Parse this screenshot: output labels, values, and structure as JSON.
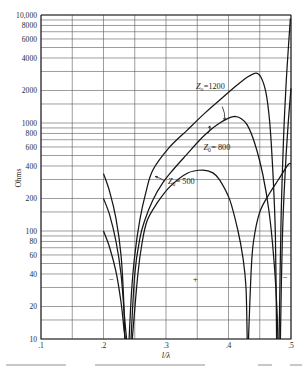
{
  "chart_data": {
    "type": "line",
    "title": "",
    "xlabel": "l/λ",
    "ylabel": "Ohms",
    "xlim": [
      0.1,
      0.5
    ],
    "ylim": [
      10,
      10000
    ],
    "yscale": "log",
    "grid": true,
    "x_ticks": [
      {
        "value": 0.1,
        "label": ".1"
      },
      {
        "value": 0.2,
        "label": ".2"
      },
      {
        "value": 0.3,
        "label": ".3"
      },
      {
        "value": 0.4,
        "label": ".4"
      },
      {
        "value": 0.5,
        "label": ".5"
      }
    ],
    "x_gridlines": [
      0.1,
      0.15,
      0.2,
      0.25,
      0.3,
      0.35,
      0.4,
      0.45,
      0.5
    ],
    "y_ticks": [
      {
        "value": 10000,
        "label": "10,000"
      },
      {
        "value": 8000,
        "label": "8000"
      },
      {
        "value": 6000,
        "label": "6000"
      },
      {
        "value": 4000,
        "label": "4000"
      },
      {
        "value": 2000,
        "label": "2000"
      },
      {
        "value": 1000,
        "label": "1000"
      },
      {
        "value": 800,
        "label": "800"
      },
      {
        "value": 600,
        "label": "600"
      },
      {
        "value": 400,
        "label": "400"
      },
      {
        "value": 200,
        "label": "200"
      },
      {
        "value": 100,
        "label": "100"
      },
      {
        "value": 80,
        "label": "80"
      },
      {
        "value": 60,
        "label": "60"
      },
      {
        "value": 40,
        "label": "40"
      },
      {
        "value": 20,
        "label": "20"
      },
      {
        "value": 10,
        "label": "10"
      }
    ],
    "y_gridlines": [
      10,
      15,
      20,
      30,
      40,
      50,
      60,
      70,
      80,
      90,
      100,
      150,
      200,
      300,
      400,
      500,
      600,
      700,
      800,
      900,
      1000,
      1500,
      2000,
      3000,
      4000,
      5000,
      6000,
      7000,
      8000,
      9000,
      10000
    ],
    "series": [
      {
        "name": "Z0 = 1200",
        "segments": [
          [
            [
              0.2,
              340
            ],
            [
              0.21,
              230
            ],
            [
              0.22,
              130
            ],
            [
              0.228,
              60
            ],
            [
              0.232,
              25
            ],
            [
              0.234,
              10
            ]
          ],
          [
            [
              0.241,
              10
            ],
            [
              0.245,
              28
            ],
            [
              0.25,
              60
            ],
            [
              0.258,
              126
            ],
            [
              0.268,
              230
            ],
            [
              0.279,
              367
            ],
            [
              0.305,
              590
            ],
            [
              0.334,
              860
            ],
            [
              0.36,
              1200
            ],
            [
              0.386,
              1630
            ],
            [
              0.41,
              2150
            ],
            [
              0.43,
              2650
            ],
            [
              0.444,
              2900
            ],
            [
              0.452,
              2650
            ],
            [
              0.46,
              1900
            ],
            [
              0.466,
              1000
            ],
            [
              0.471,
              350
            ],
            [
              0.475,
              90
            ],
            [
              0.477,
              10
            ]
          ],
          [
            [
              0.481,
              10
            ],
            [
              0.484,
              120
            ],
            [
              0.488,
              700
            ],
            [
              0.492,
              2200
            ],
            [
              0.496,
              5200
            ],
            [
              0.499,
              9300
            ]
          ]
        ]
      },
      {
        "name": "Z0 = 800",
        "segments": [
          [
            [
              0.2,
              200
            ],
            [
              0.21,
              140
            ],
            [
              0.22,
              80
            ],
            [
              0.228,
              40
            ],
            [
              0.234,
              15
            ],
            [
              0.237,
              10
            ]
          ],
          [
            [
              0.244,
              10
            ],
            [
              0.25,
              40
            ],
            [
              0.258,
              85
            ],
            [
              0.266,
              126
            ],
            [
              0.279,
              194
            ],
            [
              0.295,
              280
            ],
            [
              0.311,
              367
            ],
            [
              0.333,
              510
            ],
            [
              0.354,
              696
            ],
            [
              0.372,
              870
            ],
            [
              0.386,
              1000
            ],
            [
              0.4,
              1110
            ],
            [
              0.41,
              1150
            ],
            [
              0.42,
              1100
            ],
            [
              0.43,
              960
            ],
            [
              0.442,
              650
            ],
            [
              0.455,
              330
            ],
            [
              0.465,
              150
            ],
            [
              0.472,
              60
            ],
            [
              0.477,
              22
            ],
            [
              0.479,
              10
            ]
          ],
          [
            [
              0.483,
              10
            ],
            [
              0.486,
              80
            ],
            [
              0.49,
              300
            ],
            [
              0.495,
              900
            ],
            [
              0.5,
              2100
            ]
          ]
        ]
      },
      {
        "name": "Z0 = 500",
        "segments": [
          [
            [
              0.2,
              100
            ],
            [
              0.21,
              70
            ],
            [
              0.22,
              42
            ],
            [
              0.228,
              22
            ],
            [
              0.233,
              12
            ],
            [
              0.235,
              10
            ]
          ],
          [
            [
              0.246,
              10
            ],
            [
              0.255,
              40
            ],
            [
              0.262,
              80
            ],
            [
              0.27,
              126
            ],
            [
              0.286,
              182
            ],
            [
              0.306,
              256
            ],
            [
              0.334,
              343
            ],
            [
              0.359,
              367
            ],
            [
              0.375,
              345
            ],
            [
              0.386,
              296
            ],
            [
              0.402,
              194
            ],
            [
              0.415,
              101
            ],
            [
              0.423,
              57
            ],
            [
              0.428,
              30
            ],
            [
              0.43,
              10
            ]
          ],
          [
            [
              0.432,
              10
            ],
            [
              0.436,
              40
            ],
            [
              0.44,
              80
            ],
            [
              0.45,
              150
            ],
            [
              0.466,
              225
            ],
            [
              0.48,
              300
            ],
            [
              0.495,
              408
            ],
            [
              0.5,
              420
            ]
          ]
        ]
      }
    ],
    "annotations": [
      {
        "symbol": "Z",
        "sub": "o",
        "value": "=1200",
        "x": 0.348,
        "y": 2050,
        "leader_from": [
          0.39,
          1420
        ],
        "leader_to": [
          0.394,
          1060
        ]
      },
      {
        "symbol": "Z",
        "sub": "0",
        "value": "= 800",
        "x": 0.36,
        "y": 560,
        "leader_from": [
          0.367,
          800
        ],
        "leader_to": [
          0.37,
          940
        ]
      },
      {
        "symbol": "Z",
        "sub": "0",
        "value": "= 500",
        "x": 0.303,
        "y": 270,
        "leader_from": [
          0.298,
          290
        ],
        "leader_to": [
          0.283,
          320
        ]
      }
    ],
    "region_signs": [
      {
        "label": "−",
        "x": 0.212,
        "y": 34
      },
      {
        "label": "+",
        "x": 0.347,
        "y": 34
      },
      {
        "label": "−",
        "x": 0.49,
        "y": 35
      }
    ]
  },
  "caption": {
    "text_visible": false
  }
}
